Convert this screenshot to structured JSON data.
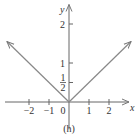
{
  "chart_data": {
    "type": "line",
    "title": "",
    "caption": "(h)",
    "xlabel": "x",
    "ylabel": "y",
    "xlim": [
      -3.2,
      3.0
    ],
    "ylim": [
      -0.7,
      2.5
    ],
    "grid": false,
    "x_ticks": [
      {
        "value": -2,
        "label": "−2"
      },
      {
        "value": -1,
        "label": "−1"
      },
      {
        "value": 1,
        "label": "1"
      },
      {
        "value": 2,
        "label": "2"
      }
    ],
    "origin_label": "0",
    "y_ticks": [
      {
        "value": 0.5,
        "label_num": "1",
        "label_den": "2",
        "fraction": true
      },
      {
        "value": 1,
        "label": "1"
      },
      {
        "value": 2,
        "label": "2"
      }
    ],
    "series": [
      {
        "name": "y = |x|/2",
        "x": [
          -3.1,
          0,
          3.1
        ],
        "y": [
          1.55,
          0,
          1.55
        ],
        "arrows_at_ends": true
      }
    ],
    "colors": {
      "curve": "#888888",
      "axis": "#666666",
      "text": "#333333"
    }
  }
}
